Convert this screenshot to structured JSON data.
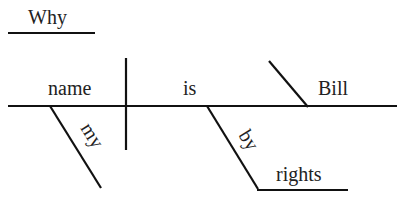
{
  "diagram": {
    "type": "sentence-diagram",
    "sentence": "Why is my name Bill by rights",
    "words": {
      "interrogative": "Why",
      "subject": "name",
      "subject_modifier": "my",
      "verb": "is",
      "complement": "Bill",
      "preposition": "by",
      "prepositional_object": "rights"
    },
    "colors": {
      "line": "#111111",
      "text": "#222222",
      "background": "#ffffff"
    }
  }
}
